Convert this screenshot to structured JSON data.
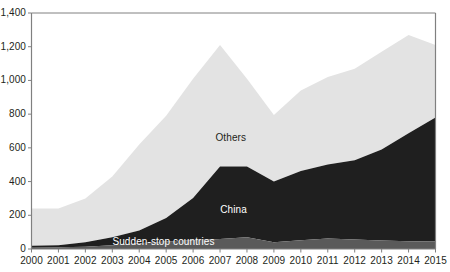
{
  "chart_data": {
    "type": "area",
    "stacked": true,
    "title": "",
    "xlabel": "",
    "ylabel": "",
    "grid": false,
    "legend_position": "inline-labels",
    "x": [
      2000,
      2001,
      2002,
      2003,
      2004,
      2005,
      2006,
      2007,
      2008,
      2009,
      2010,
      2011,
      2012,
      2013,
      2014,
      2015
    ],
    "xtick_labels": [
      "2000",
      "2001",
      "2002",
      "2003",
      "2004",
      "2005",
      "2006",
      "2007",
      "2008",
      "2009",
      "2010",
      "2011",
      "2012",
      "2013",
      "2014",
      "2015"
    ],
    "ytick_labels": [
      "0",
      "200",
      "400",
      "600",
      "800",
      "1,000",
      "1,200",
      "1,400"
    ],
    "yticks": [
      0,
      200,
      400,
      600,
      800,
      1000,
      1200,
      1400
    ],
    "ylim": [
      0,
      1400
    ],
    "xlim": [
      2000,
      2015
    ],
    "series": [
      {
        "name": "Sudden-stop countries",
        "color": "#5a5a5a",
        "values": [
          12,
          10,
          14,
          22,
          34,
          44,
          52,
          60,
          70,
          40,
          52,
          62,
          56,
          50,
          46,
          45
        ]
      },
      {
        "name": "China",
        "color": "#1f1f1f",
        "values": [
          8,
          12,
          26,
          48,
          76,
          140,
          250,
          430,
          420,
          360,
          410,
          440,
          470,
          540,
          640,
          735
        ]
      },
      {
        "name": "Others",
        "color": "#e3e3e3",
        "values": [
          220,
          218,
          260,
          360,
          510,
          606,
          708,
          720,
          520,
          395,
          478,
          518,
          544,
          580,
          584,
          430
        ]
      }
    ],
    "totals": [
      240,
      240,
      300,
      430,
      620,
      790,
      1010,
      1210,
      1010,
      795,
      940,
      1020,
      1070,
      1170,
      1270,
      1210
    ],
    "annotations": [
      {
        "text": "Others",
        "x": 2007.4,
        "y": 660
      },
      {
        "text": "China",
        "x": 2007.5,
        "y": 230
      },
      {
        "text": "Sudden-stop countries",
        "x": 2004.9,
        "y": 40
      }
    ]
  },
  "axis": {
    "line_color": "#808080"
  }
}
